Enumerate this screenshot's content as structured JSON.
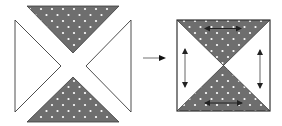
{
  "diagram": {
    "colors": {
      "shaded_fill": "#6e6e6e",
      "dot": "#ffffff",
      "outline": "#3a3a3a",
      "arrow": "#222222",
      "transition_arrow_shaft": "#9a9a9a"
    },
    "left_figure": {
      "pieces": [
        {
          "name": "top-shaded-triangle",
          "fill": "dotted"
        },
        {
          "name": "left-white-triangle",
          "fill": "white"
        },
        {
          "name": "right-white-triangle",
          "fill": "white"
        },
        {
          "name": "bottom-shaded-triangle",
          "fill": "dotted"
        }
      ]
    },
    "transition_arrow": {
      "direction": "right"
    },
    "right_figure": {
      "shape": "square",
      "arrows": [
        {
          "name": "top-horizontal",
          "type": "double-headed"
        },
        {
          "name": "bottom-horizontal",
          "type": "double-headed"
        },
        {
          "name": "left-vertical",
          "type": "double-headed"
        },
        {
          "name": "right-vertical",
          "type": "double-headed"
        }
      ]
    }
  }
}
